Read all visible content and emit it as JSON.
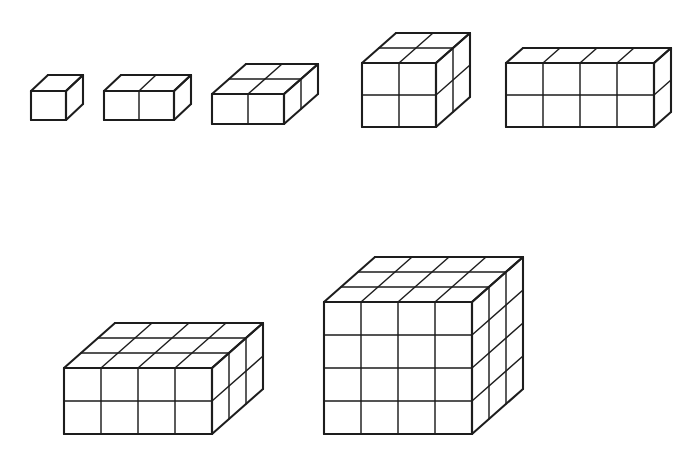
{
  "page": {
    "background_color": "#ffffff",
    "stroke_color": "#1d1d1d",
    "width": 697,
    "height": 457,
    "projection": "oblique",
    "caption": ""
  },
  "geometry": {
    "unit_width": 36,
    "unit_height": 33,
    "depth_dx": 17,
    "depth_dy": -15
  },
  "figures": [
    {
      "id": "figure-1",
      "label": "1",
      "row": "top",
      "order": 1,
      "width_cubes": 1,
      "height_cubes": 1,
      "depth_cubes": 1,
      "volume": 1,
      "origin_x": 31,
      "origin_y": 120,
      "unit_width": 35,
      "unit_height": 29,
      "depth_dx": 17,
      "depth_dy": -16
    },
    {
      "id": "figure-2",
      "label": "2",
      "row": "top",
      "order": 2,
      "width_cubes": 2,
      "height_cubes": 1,
      "depth_cubes": 1,
      "volume": 2,
      "origin_x": 104,
      "origin_y": 120,
      "unit_width": 35,
      "unit_height": 29,
      "depth_dx": 17,
      "depth_dy": -16
    },
    {
      "id": "figure-3",
      "label": "3",
      "row": "top",
      "order": 3,
      "width_cubes": 2,
      "height_cubes": 1,
      "depth_cubes": 2,
      "volume": 4,
      "origin_x": 212,
      "origin_y": 124,
      "unit_width": 36,
      "unit_height": 30,
      "depth_dx": 17,
      "depth_dy": -15
    },
    {
      "id": "figure-4",
      "label": "4",
      "row": "top",
      "order": 4,
      "width_cubes": 2,
      "height_cubes": 2,
      "depth_cubes": 2,
      "volume": 8,
      "origin_x": 362,
      "origin_y": 127,
      "unit_width": 37,
      "unit_height": 32,
      "depth_dx": 17,
      "depth_dy": -15
    },
    {
      "id": "figure-5",
      "label": "5",
      "row": "top",
      "order": 5,
      "width_cubes": 4,
      "height_cubes": 2,
      "depth_cubes": 1,
      "volume": 8,
      "origin_x": 506,
      "origin_y": 127,
      "unit_width": 37,
      "unit_height": 32,
      "depth_dx": 17,
      "depth_dy": -15
    },
    {
      "id": "figure-6",
      "label": "6",
      "row": "bottom",
      "order": 6,
      "width_cubes": 4,
      "height_cubes": 2,
      "depth_cubes": 3,
      "volume": 24,
      "origin_x": 64,
      "origin_y": 434,
      "unit_width": 37,
      "unit_height": 33,
      "depth_dx": 17,
      "depth_dy": -15
    },
    {
      "id": "figure-7",
      "label": "7",
      "row": "bottom",
      "order": 7,
      "width_cubes": 4,
      "height_cubes": 4,
      "depth_cubes": 3,
      "volume": 48,
      "origin_x": 324,
      "origin_y": 434,
      "unit_width": 37,
      "unit_height": 33,
      "depth_dx": 17,
      "depth_dy": -15
    }
  ]
}
